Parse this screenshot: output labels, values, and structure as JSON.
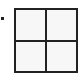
{
  "icon": {
    "name": "grid-2x2-icon",
    "rows": 2,
    "cols": 2,
    "stroke_color": "#222222",
    "fill_color": "#f7f7f7"
  },
  "bullet": {
    "name": "bullet-dot",
    "color": "#222222"
  },
  "cells": [
    {
      "label": ""
    },
    {
      "label": ""
    },
    {
      "label": ""
    },
    {
      "label": ""
    }
  ]
}
